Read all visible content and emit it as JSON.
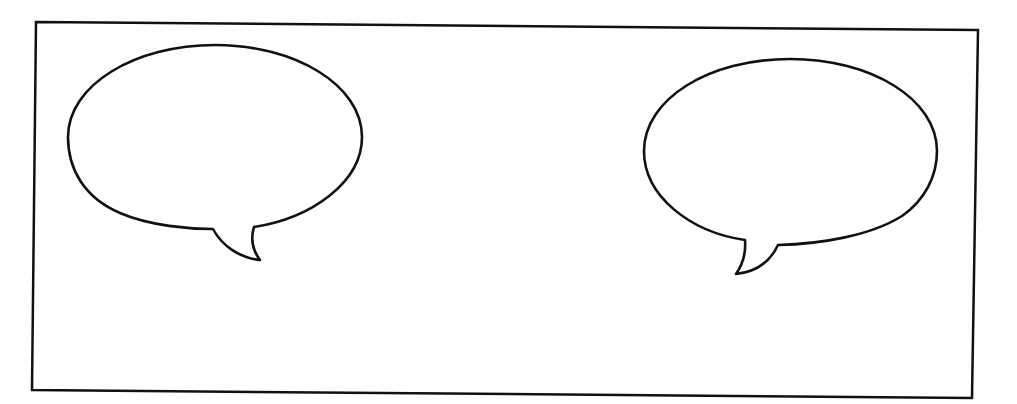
{
  "scene": {
    "type": "comic-panel",
    "background_color": "#ffffff",
    "line_color": "#111111"
  },
  "panel": {
    "label": "Empty comic panel"
  },
  "bubbles": [
    {
      "id": "left",
      "kind": "speech-bubble",
      "text": "",
      "tail_direction": "down-right"
    },
    {
      "id": "right",
      "kind": "speech-bubble",
      "text": "",
      "tail_direction": "down-left"
    }
  ]
}
